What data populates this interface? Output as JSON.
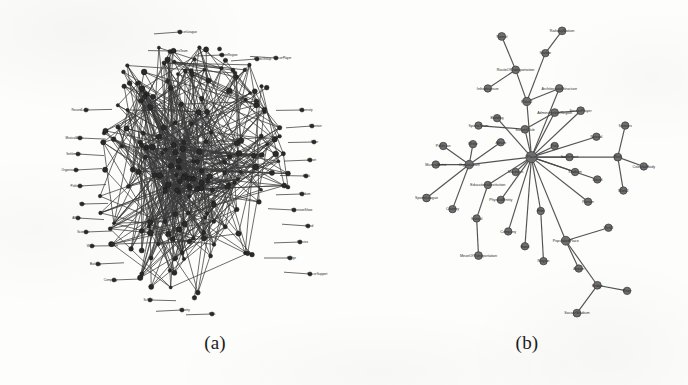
{
  "figure": {
    "panels": [
      {
        "id": "a",
        "caption": "(a)",
        "kind": "dense-graph"
      },
      {
        "id": "b",
        "caption": "(b)",
        "kind": "star-graph"
      }
    ]
  },
  "colors": {
    "background": "#fdfdfb",
    "node_a": "#2a2a2a",
    "node_b": "#6e6e6e",
    "edge": "#3a3a3a",
    "text": "#1b1b1b"
  },
  "chart_data": [
    {
      "type": "scatter",
      "id": "panel-a",
      "title": "(a)",
      "layout": "dense force-directed hairball",
      "node_count": 196,
      "edge_count": 620,
      "labels_visible": [
        "SoccerLeague",
        "SportsTeam",
        "AdministrativeRegion",
        "EthnicGroup",
        "SoccerPlayer",
        "MusicalArtist",
        "RecordLabel",
        "Settlement",
        "Film",
        "TelevisionShow",
        "Politician",
        "Album",
        "Band",
        "Organisation",
        "Company",
        "Country",
        "University",
        "Writer",
        "Scientist",
        "Building",
        "Mountain",
        "River",
        "Airport",
        "Book"
      ],
      "xlabel": "",
      "ylabel": ""
    },
    {
      "type": "scatter",
      "id": "panel-b",
      "title": "(b)",
      "layout": "star / hub-and-spoke",
      "node_count": 45,
      "edge_count": 47,
      "hub_label": "Place",
      "labels_visible": [
        "RouteOfTransportation",
        "ArchitecturalStructure",
        "ModeOfTransportation",
        "PopulatedPlace",
        "AdministrativeRegion",
        "SoccerPlayer",
        "Settlement",
        "Country",
        "Station",
        "Airport",
        "Bridge",
        "Building",
        "School",
        "Person",
        "Band",
        "Album",
        "Work",
        "Species",
        "Company",
        "Organisation",
        "Stadium",
        "Park",
        "River",
        "Mountain",
        "Island"
      ],
      "xlabel": "",
      "ylabel": ""
    }
  ],
  "panel_a": {
    "caption": "(a)",
    "peripheral_labels": [
      {
        "text": "SoccerLeague",
        "x": 118,
        "y": 14
      },
      {
        "text": "SportsTeam",
        "x": 112,
        "y": 33
      },
      {
        "text": "AdminRegion",
        "x": 160,
        "y": 37
      },
      {
        "text": "EthnicGroup",
        "x": 195,
        "y": 41
      },
      {
        "text": "SoccerPlayer",
        "x": 214,
        "y": 40
      },
      {
        "text": "RecordLabel",
        "x": 24,
        "y": 92
      },
      {
        "text": "MusicalArtist",
        "x": 18,
        "y": 120
      },
      {
        "text": "Settlement",
        "x": 16,
        "y": 136
      },
      {
        "text": "Organisation",
        "x": 14,
        "y": 152
      },
      {
        "text": "Politician",
        "x": 18,
        "y": 168
      },
      {
        "text": "Film",
        "x": 20,
        "y": 186
      },
      {
        "text": "Album",
        "x": 16,
        "y": 200
      },
      {
        "text": "Scientist",
        "x": 24,
        "y": 214
      },
      {
        "text": "Writer",
        "x": 30,
        "y": 228
      },
      {
        "text": "Building",
        "x": 36,
        "y": 246
      },
      {
        "text": "Company",
        "x": 52,
        "y": 262
      },
      {
        "text": "University",
        "x": 240,
        "y": 92
      },
      {
        "text": "Mountain",
        "x": 250,
        "y": 108
      },
      {
        "text": "River",
        "x": 252,
        "y": 124
      },
      {
        "text": "Airport",
        "x": 248,
        "y": 142
      },
      {
        "text": "Book",
        "x": 244,
        "y": 158
      },
      {
        "text": "Stadium",
        "x": 240,
        "y": 176
      },
      {
        "text": "TelevisionShow",
        "x": 232,
        "y": 192
      },
      {
        "text": "Island",
        "x": 246,
        "y": 208
      },
      {
        "text": "Species",
        "x": 238,
        "y": 224
      },
      {
        "text": "Bridge",
        "x": 228,
        "y": 240
      },
      {
        "text": "SoccerSupport",
        "x": 248,
        "y": 256
      },
      {
        "text": "Country",
        "x": 120,
        "y": 292
      },
      {
        "text": "School",
        "x": 88,
        "y": 282
      },
      {
        "text": "Park",
        "x": 150,
        "y": 296
      }
    ]
  },
  "panel_b": {
    "caption": "(b)",
    "nodes": [
      {
        "id": "n0",
        "label": "Place",
        "x": 125,
        "y": 152,
        "r": 6.0,
        "label_pos": "center"
      },
      {
        "id": "n1",
        "label": "Place2",
        "x": 120,
        "y": 92,
        "r": 4.4,
        "label_pos": "center"
      },
      {
        "id": "n2",
        "label": "RouteOfTransportation",
        "x": 108,
        "y": 58,
        "r": 4.2,
        "label_pos": "center"
      },
      {
        "id": "n3",
        "label": "Tunnel",
        "x": 93,
        "y": 22,
        "r": 4.2,
        "label_pos": "center"
      },
      {
        "id": "n4",
        "label": "Station",
        "x": 140,
        "y": 40,
        "r": 4.0,
        "label_pos": "center"
      },
      {
        "id": "n5",
        "label": "RailwayStation",
        "x": 158,
        "y": 16,
        "r": 4.2,
        "label_pos": "center"
      },
      {
        "id": "n6",
        "label": "Infrastructure",
        "x": 78,
        "y": 78,
        "r": 4.0,
        "label_pos": "center"
      },
      {
        "id": "n7",
        "label": "ArchitecturalStructure",
        "x": 155,
        "y": 78,
        "r": 4.2,
        "label_pos": "center"
      },
      {
        "id": "n8",
        "label": "Building",
        "x": 88,
        "y": 110,
        "r": 4.0,
        "label_pos": "center"
      },
      {
        "id": "n9",
        "label": "SportsTeam",
        "x": 68,
        "y": 118,
        "r": 4.0,
        "label_pos": "center"
      },
      {
        "id": "n10",
        "label": "SoccerClub",
        "x": 118,
        "y": 122,
        "r": 4.2,
        "label_pos": "center"
      },
      {
        "id": "n11",
        "label": "AdministrativeRegion",
        "x": 150,
        "y": 104,
        "r": 4.2,
        "label_pos": "center"
      },
      {
        "id": "n12",
        "label": "SoccerPlayer",
        "x": 178,
        "y": 102,
        "r": 4.2,
        "label_pos": "center"
      },
      {
        "id": "n13",
        "label": "Politician",
        "x": 30,
        "y": 140,
        "r": 4.0,
        "label_pos": "center"
      },
      {
        "id": "n14",
        "label": "Writer",
        "x": 62,
        "y": 138,
        "r": 4.0,
        "label_pos": "center"
      },
      {
        "id": "n15",
        "label": "Album",
        "x": 92,
        "y": 136,
        "r": 4.0,
        "label_pos": "center"
      },
      {
        "id": "n16",
        "label": "Organisation",
        "x": 58,
        "y": 160,
        "r": 4.6,
        "label_pos": "center"
      },
      {
        "id": "n17",
        "label": "MusicalArtist",
        "x": 22,
        "y": 160,
        "r": 4.0,
        "label_pos": "center"
      },
      {
        "id": "n18",
        "label": "SportsLeague",
        "x": 12,
        "y": 196,
        "r": 4.2,
        "label_pos": "center"
      },
      {
        "id": "n19",
        "label": "Country",
        "x": 40,
        "y": 208,
        "r": 4.0,
        "label_pos": "center"
      },
      {
        "id": "n20",
        "label": "EducationalInstitution",
        "x": 78,
        "y": 182,
        "r": 4.0,
        "label_pos": "center"
      },
      {
        "id": "n21",
        "label": "PhysicalEntity",
        "x": 92,
        "y": 198,
        "r": 4.0,
        "label_pos": "center"
      },
      {
        "id": "n22",
        "label": "School",
        "x": 66,
        "y": 218,
        "r": 4.0,
        "label_pos": "center"
      },
      {
        "id": "n23",
        "label": "Company",
        "x": 100,
        "y": 232,
        "r": 4.0,
        "label_pos": "center"
      },
      {
        "id": "n24",
        "label": "MeanOfTransportation",
        "x": 68,
        "y": 258,
        "r": 4.2,
        "label_pos": "center"
      },
      {
        "id": "n25",
        "label": "Park",
        "x": 150,
        "y": 140,
        "r": 4.0,
        "label_pos": "center"
      },
      {
        "id": "n26",
        "label": "Settlement",
        "x": 166,
        "y": 152,
        "r": 4.0,
        "label_pos": "center"
      },
      {
        "id": "n27",
        "label": "Stadium",
        "x": 172,
        "y": 168,
        "r": 4.0,
        "label_pos": "center"
      },
      {
        "id": "n28",
        "label": "Person",
        "x": 186,
        "y": 200,
        "r": 4.0,
        "label_pos": "center"
      },
      {
        "id": "n29",
        "label": "Natural",
        "x": 195,
        "y": 130,
        "r": 4.0,
        "label_pos": "center"
      },
      {
        "id": "n30",
        "label": "Work",
        "x": 218,
        "y": 152,
        "r": 4.2,
        "label_pos": "center"
      },
      {
        "id": "n31",
        "label": "Species",
        "x": 226,
        "y": 118,
        "r": 4.0,
        "label_pos": "center"
      },
      {
        "id": "n32",
        "label": "CelestialBody",
        "x": 246,
        "y": 162,
        "r": 4.0,
        "label_pos": "center"
      },
      {
        "id": "n33",
        "label": "Work2",
        "x": 224,
        "y": 188,
        "r": 4.0,
        "label_pos": "center"
      },
      {
        "id": "n34",
        "label": "Film",
        "x": 135,
        "y": 210,
        "r": 4.0,
        "label_pos": "center"
      },
      {
        "id": "n35",
        "label": "PopulatedPlace",
        "x": 162,
        "y": 242,
        "r": 4.8,
        "label_pos": "center"
      },
      {
        "id": "n36",
        "label": "Park2",
        "x": 208,
        "y": 228,
        "r": 4.0,
        "label_pos": "center"
      },
      {
        "id": "n37",
        "label": "Region",
        "x": 138,
        "y": 264,
        "r": 4.0,
        "label_pos": "center"
      },
      {
        "id": "n38",
        "label": "Airport",
        "x": 176,
        "y": 272,
        "r": 4.0,
        "label_pos": "center"
      },
      {
        "id": "n39",
        "label": "Bridge",
        "x": 196,
        "y": 290,
        "r": 4.2,
        "label_pos": "center"
      },
      {
        "id": "n40",
        "label": "River",
        "x": 228,
        "y": 296,
        "r": 4.0,
        "label_pos": "center"
      },
      {
        "id": "n41",
        "label": "SoccerStadium",
        "x": 174,
        "y": 320,
        "r": 4.2,
        "label_pos": "center"
      },
      {
        "id": "n42",
        "label": "Mountain",
        "x": 108,
        "y": 168,
        "r": 4.0,
        "label_pos": "center"
      },
      {
        "id": "n43",
        "label": "Island",
        "x": 196,
        "y": 176,
        "r": 4.0,
        "label_pos": "center"
      },
      {
        "id": "n44",
        "label": "Band",
        "x": 118,
        "y": 248,
        "r": 4.0,
        "label_pos": "center"
      }
    ],
    "edges": [
      [
        "n0",
        "n1"
      ],
      [
        "n1",
        "n2"
      ],
      [
        "n2",
        "n3"
      ],
      [
        "n1",
        "n4"
      ],
      [
        "n4",
        "n5"
      ],
      [
        "n2",
        "n6"
      ],
      [
        "n1",
        "n7"
      ],
      [
        "n0",
        "n8"
      ],
      [
        "n0",
        "n10"
      ],
      [
        "n10",
        "n9"
      ],
      [
        "n10",
        "n11"
      ],
      [
        "n11",
        "n12"
      ],
      [
        "n0",
        "n16"
      ],
      [
        "n16",
        "n13"
      ],
      [
        "n16",
        "n14"
      ],
      [
        "n16",
        "n15"
      ],
      [
        "n16",
        "n17"
      ],
      [
        "n16",
        "n18"
      ],
      [
        "n16",
        "n19"
      ],
      [
        "n0",
        "n20"
      ],
      [
        "n0",
        "n21"
      ],
      [
        "n20",
        "n22"
      ],
      [
        "n22",
        "n24"
      ],
      [
        "n0",
        "n23"
      ],
      [
        "n0",
        "n25"
      ],
      [
        "n0",
        "n26"
      ],
      [
        "n0",
        "n27"
      ],
      [
        "n0",
        "n28"
      ],
      [
        "n0",
        "n29"
      ],
      [
        "n0",
        "n30"
      ],
      [
        "n30",
        "n31"
      ],
      [
        "n30",
        "n32"
      ],
      [
        "n30",
        "n33"
      ],
      [
        "n0",
        "n34"
      ],
      [
        "n0",
        "n35"
      ],
      [
        "n35",
        "n36"
      ],
      [
        "n34",
        "n37"
      ],
      [
        "n35",
        "n38"
      ],
      [
        "n35",
        "n39"
      ],
      [
        "n39",
        "n40"
      ],
      [
        "n39",
        "n41"
      ],
      [
        "n0",
        "n42"
      ],
      [
        "n0",
        "n43"
      ],
      [
        "n0",
        "n44"
      ],
      [
        "n0",
        "n12"
      ],
      [
        "n0",
        "n7"
      ],
      [
        "n0",
        "n11"
      ]
    ]
  }
}
